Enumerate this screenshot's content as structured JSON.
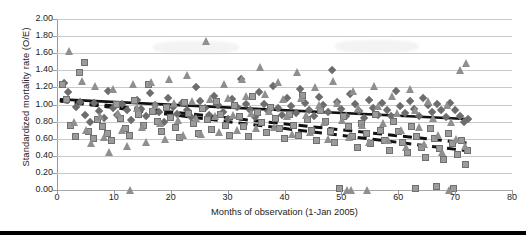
{
  "chart_data": {
    "type": "scatter",
    "title": "",
    "xlabel": "Months of observation (1-Jan 2005)",
    "ylabel": "Standardized mortality rate (O/E)",
    "xlim": [
      0,
      80
    ],
    "ylim": [
      0,
      2.0
    ],
    "xticks": [
      0,
      10,
      20,
      30,
      40,
      50,
      60,
      70,
      80
    ],
    "xticklabels": [
      "0",
      "10",
      "20",
      "30",
      "40",
      "50",
      "60",
      "70",
      "80"
    ],
    "yticks": [
      0.0,
      0.2,
      0.4,
      0.6,
      0.8,
      1.0,
      1.2,
      1.4,
      1.6,
      1.8,
      2.0
    ],
    "yticklabels": [
      "0.00",
      "0.20",
      "0.40",
      "0.60",
      "0.80",
      "1.00",
      "1.20",
      "1.40",
      "1.60",
      "1.80",
      "2.00"
    ],
    "grid": "horizontal",
    "legend": "none",
    "colors": {
      "square": "#9b9b9b",
      "square_edge": "#6f6f6f",
      "triangle": "#8f8f8f",
      "diamond": "#6d6d6d",
      "trend_solid": "#111111",
      "trend_dashed": "#111111",
      "gridline": "#c9c9c9",
      "axis": "#9a9a9a",
      "rule": "#000000"
    },
    "series": [
      {
        "name": "diamond-series",
        "marker": "diamond",
        "points": [
          [
            1.2,
            1.25
          ],
          [
            2.0,
            1.14
          ],
          [
            3.4,
            0.97
          ],
          [
            4.1,
            1.03
          ],
          [
            5.0,
            0.88
          ],
          [
            5.8,
            0.79
          ],
          [
            6.6,
            1.02
          ],
          [
            7.4,
            0.92
          ],
          [
            8.2,
            0.84
          ],
          [
            9.0,
            1.16
          ],
          [
            9.8,
            0.96
          ],
          [
            10.6,
            0.88
          ],
          [
            11.5,
            1.0
          ],
          [
            12.3,
            0.93
          ],
          [
            13.1,
            0.82
          ],
          [
            14.0,
            1.05
          ],
          [
            14.8,
            0.95
          ],
          [
            15.6,
            0.87
          ],
          [
            16.4,
            1.13
          ],
          [
            17.2,
            0.99
          ],
          [
            18.0,
            0.91
          ],
          [
            18.8,
            0.8
          ],
          [
            19.6,
            1.08
          ],
          [
            20.4,
            0.97
          ],
          [
            21.2,
            0.89
          ],
          [
            22.0,
            1.02
          ],
          [
            22.8,
            0.93
          ],
          [
            23.6,
            0.85
          ],
          [
            24.4,
            1.2
          ],
          [
            25.2,
            1.04
          ],
          [
            26.0,
            0.96
          ],
          [
            26.8,
            0.88
          ],
          [
            27.6,
            1.1
          ],
          [
            28.4,
            0.99
          ],
          [
            29.2,
            0.91
          ],
          [
            30.0,
            0.83
          ],
          [
            30.8,
            1.06
          ],
          [
            31.6,
            0.97
          ],
          [
            32.4,
            1.3
          ],
          [
            33.2,
            1.01
          ],
          [
            34.0,
            0.93
          ],
          [
            34.8,
            0.85
          ],
          [
            35.6,
            1.14
          ],
          [
            36.4,
            1.0
          ],
          [
            37.2,
            0.92
          ],
          [
            38.0,
            1.22
          ],
          [
            38.8,
            0.96
          ],
          [
            39.6,
            0.88
          ],
          [
            40.4,
            1.07
          ],
          [
            41.2,
            0.98
          ],
          [
            42.0,
            0.9
          ],
          [
            42.8,
            1.18
          ],
          [
            43.6,
            1.02
          ],
          [
            44.4,
            0.94
          ],
          [
            45.2,
            0.86
          ],
          [
            46.0,
            1.09
          ],
          [
            46.8,
            0.99
          ],
          [
            47.6,
            0.91
          ],
          [
            48.4,
            1.4
          ],
          [
            49.2,
            1.03
          ],
          [
            50.0,
            0.95
          ],
          [
            50.8,
            0.87
          ],
          [
            51.6,
            1.12
          ],
          [
            52.4,
            1.0
          ],
          [
            53.2,
            0.92
          ],
          [
            54.0,
            0.84
          ],
          [
            54.8,
            1.05
          ],
          [
            55.6,
            0.96
          ],
          [
            56.4,
            0.88
          ],
          [
            57.2,
            1.02
          ],
          [
            58.0,
            0.94
          ],
          [
            58.8,
            0.86
          ],
          [
            59.6,
            1.16
          ],
          [
            60.4,
            0.98
          ],
          [
            61.2,
            0.9
          ],
          [
            62.0,
            1.04
          ],
          [
            62.8,
            0.95
          ],
          [
            63.6,
            0.87
          ],
          [
            64.4,
            1.08
          ],
          [
            65.2,
            0.99
          ],
          [
            66.0,
            0.91
          ],
          [
            66.8,
            1.0
          ],
          [
            67.6,
            0.93
          ],
          [
            68.4,
            0.85
          ],
          [
            69.2,
            1.02
          ],
          [
            70.0,
            0.94
          ],
          [
            70.8,
            0.86
          ],
          [
            71.6,
            0.79
          ],
          [
            72.2,
            0.83
          ]
        ]
      },
      {
        "name": "square-series",
        "marker": "square",
        "points": [
          [
            1.0,
            1.23
          ],
          [
            1.6,
            1.06
          ],
          [
            2.4,
            0.76
          ],
          [
            3.2,
            0.62
          ],
          [
            4.0,
            1.37
          ],
          [
            4.8,
            1.49
          ],
          [
            5.6,
            0.68
          ],
          [
            6.4,
            0.6
          ],
          [
            7.2,
            0.82
          ],
          [
            8.0,
            0.74
          ],
          [
            8.8,
            0.66
          ],
          [
            9.6,
            0.58
          ],
          [
            10.4,
            1.0
          ],
          [
            11.2,
            0.84
          ],
          [
            12.0,
            0.72
          ],
          [
            12.8,
            0.64
          ],
          [
            13.6,
            1.05
          ],
          [
            14.4,
            0.88
          ],
          [
            15.2,
            0.76
          ],
          [
            16.0,
            1.23
          ],
          [
            16.8,
            0.92
          ],
          [
            17.6,
            0.8
          ],
          [
            18.4,
            0.68
          ],
          [
            19.2,
            0.97
          ],
          [
            20.0,
            0.85
          ],
          [
            20.8,
            0.73
          ],
          [
            21.6,
            0.61
          ],
          [
            22.4,
            1.02
          ],
          [
            23.2,
            0.9
          ],
          [
            24.0,
            0.78
          ],
          [
            24.8,
            0.66
          ],
          [
            25.6,
            0.95
          ],
          [
            26.4,
            0.83
          ],
          [
            27.2,
            0.71
          ],
          [
            28.0,
            1.04
          ],
          [
            28.8,
            0.88
          ],
          [
            29.6,
            0.76
          ],
          [
            30.4,
            0.64
          ],
          [
            31.2,
            0.99
          ],
          [
            32.0,
            0.86
          ],
          [
            32.8,
            0.74
          ],
          [
            33.6,
            0.62
          ],
          [
            34.4,
            1.09
          ],
          [
            35.2,
            0.91
          ],
          [
            36.0,
            0.79
          ],
          [
            36.8,
            0.67
          ],
          [
            37.6,
            0.96
          ],
          [
            38.4,
            0.84
          ],
          [
            39.2,
            0.72
          ],
          [
            40.0,
            0.6
          ],
          [
            40.8,
            0.88
          ],
          [
            41.6,
            0.76
          ],
          [
            42.4,
            0.64
          ],
          [
            43.2,
            1.1
          ],
          [
            44.0,
            0.82
          ],
          [
            44.8,
            0.7
          ],
          [
            45.6,
            0.58
          ],
          [
            46.4,
            0.93
          ],
          [
            47.2,
            0.8
          ],
          [
            48.0,
            0.68
          ],
          [
            48.8,
            0.56
          ],
          [
            49.6,
            0.02
          ],
          [
            50.4,
            0.86
          ],
          [
            51.2,
            0.74
          ],
          [
            52.0,
            0.62
          ],
          [
            52.8,
            0.5
          ],
          [
            53.6,
            0.78
          ],
          [
            54.4,
            0.66
          ],
          [
            55.2,
            0.54
          ],
          [
            56.0,
            0.88
          ],
          [
            56.8,
            0.7
          ],
          [
            57.6,
            0.58
          ],
          [
            58.4,
            0.46
          ],
          [
            59.2,
            0.8
          ],
          [
            60.0,
            0.68
          ],
          [
            60.8,
            0.56
          ],
          [
            61.6,
            0.44
          ],
          [
            62.4,
            0.74
          ],
          [
            63.0,
            0.02
          ],
          [
            63.2,
            0.62
          ],
          [
            64.0,
            0.5
          ],
          [
            64.8,
            0.38
          ],
          [
            65.6,
            0.72
          ],
          [
            66.4,
            0.6
          ],
          [
            66.8,
            0.04
          ],
          [
            67.2,
            0.48
          ],
          [
            68.0,
            0.36
          ],
          [
            68.8,
            0.66
          ],
          [
            69.6,
            0.54
          ],
          [
            69.8,
            0.02
          ],
          [
            70.4,
            0.42
          ],
          [
            71.2,
            0.58
          ],
          [
            71.8,
            0.3
          ],
          [
            72.2,
            0.46
          ]
        ]
      },
      {
        "name": "triangle-series",
        "marker": "triangle",
        "points": [
          [
            2.2,
            1.62
          ],
          [
            3.0,
            0.8
          ],
          [
            4.4,
            1.28
          ],
          [
            5.2,
            0.7
          ],
          [
            6.0,
            0.55
          ],
          [
            6.8,
            1.22
          ],
          [
            7.6,
            0.86
          ],
          [
            8.4,
            0.62
          ],
          [
            9.2,
            0.45
          ],
          [
            10.0,
            1.18
          ],
          [
            10.8,
            0.9
          ],
          [
            11.6,
            0.7
          ],
          [
            12.4,
            0.52
          ],
          [
            13.0,
            0.0
          ],
          [
            13.4,
            1.24
          ],
          [
            14.2,
            0.96
          ],
          [
            15.0,
            0.74
          ],
          [
            15.8,
            0.56
          ],
          [
            16.6,
            1.26
          ],
          [
            17.4,
            1.0
          ],
          [
            18.2,
            0.78
          ],
          [
            19.0,
            0.6
          ],
          [
            19.8,
            1.3
          ],
          [
            20.6,
            1.02
          ],
          [
            21.4,
            0.82
          ],
          [
            22.2,
            0.64
          ],
          [
            23.0,
            1.34
          ],
          [
            23.8,
            1.04
          ],
          [
            24.6,
            0.84
          ],
          [
            25.4,
            0.66
          ],
          [
            26.2,
            1.74
          ],
          [
            27.0,
            1.06
          ],
          [
            27.8,
            0.86
          ],
          [
            28.6,
            0.68
          ],
          [
            29.4,
            1.24
          ],
          [
            30.2,
            1.08
          ],
          [
            31.0,
            0.88
          ],
          [
            31.8,
            0.7
          ],
          [
            32.6,
            1.3
          ],
          [
            33.4,
            1.1
          ],
          [
            34.2,
            0.9
          ],
          [
            35.0,
            0.72
          ],
          [
            35.8,
            1.44
          ],
          [
            36.6,
            1.12
          ],
          [
            37.4,
            0.92
          ],
          [
            38.2,
            0.74
          ],
          [
            39.0,
            1.26
          ],
          [
            39.8,
            1.06
          ],
          [
            40.6,
            0.86
          ],
          [
            41.4,
            0.66
          ],
          [
            42.2,
            1.38
          ],
          [
            43.0,
            1.08
          ],
          [
            43.8,
            0.88
          ],
          [
            44.6,
            0.68
          ],
          [
            45.4,
            1.2
          ],
          [
            46.2,
            1.0
          ],
          [
            47.0,
            0.8
          ],
          [
            47.8,
            0.6
          ],
          [
            48.6,
            1.28
          ],
          [
            49.4,
            1.02
          ],
          [
            50.2,
            0.82
          ],
          [
            51.0,
            0.0
          ],
          [
            51.4,
            0.62
          ],
          [
            51.8,
            0.0
          ],
          [
            52.2,
            1.16
          ],
          [
            53.0,
            0.96
          ],
          [
            53.8,
            0.76
          ],
          [
            54.6,
            0.0
          ],
          [
            55.0,
            0.56
          ],
          [
            55.8,
            1.22
          ],
          [
            56.6,
            0.98
          ],
          [
            57.4,
            0.78
          ],
          [
            58.2,
            0.58
          ],
          [
            59.0,
            1.1
          ],
          [
            59.8,
            0.9
          ],
          [
            60.6,
            0.7
          ],
          [
            61.4,
            0.5
          ],
          [
            62.2,
            1.18
          ],
          [
            63.0,
            0.94
          ],
          [
            63.8,
            0.74
          ],
          [
            64.6,
            0.54
          ],
          [
            65.4,
            1.04
          ],
          [
            66.2,
            0.84
          ],
          [
            67.0,
            0.64
          ],
          [
            67.8,
            0.44
          ],
          [
            68.6,
            1.0
          ],
          [
            69.0,
            0.0
          ],
          [
            69.4,
            0.8
          ],
          [
            70.2,
            0.6
          ],
          [
            71.0,
            1.4
          ],
          [
            71.8,
            0.52
          ],
          [
            72.0,
            1.48
          ]
        ]
      }
    ],
    "trend_lines": [
      {
        "name": "solid-trend",
        "style": "solid",
        "x0": 0.5,
        "y0": 1.06,
        "x1": 72.0,
        "y1": 0.83
      },
      {
        "name": "dashed-trend-upper",
        "style": "dashed",
        "x0": 0.5,
        "y0": 1.05,
        "x1": 72.0,
        "y1": 0.55
      },
      {
        "name": "dashed-trend-lower",
        "style": "dashed",
        "x0": 0.5,
        "y0": 1.04,
        "x1": 72.0,
        "y1": 0.46
      }
    ]
  }
}
